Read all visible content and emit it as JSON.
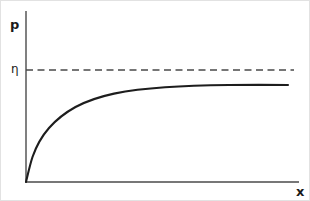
{
  "figure": {
    "background_color": "#ffffff",
    "border_color": "#e2e2e2",
    "axis_color": "#4a4a4a",
    "curve_color": "#1d1d1d"
  },
  "labels": {
    "y_axis": "p",
    "x_axis": "x",
    "asymptote_tick": "η"
  },
  "chart_data": {
    "type": "line",
    "title": "",
    "xlabel": "x",
    "ylabel": "p",
    "grid": false,
    "legend": null,
    "xlim": [
      0,
      1
    ],
    "ylim": [
      0,
      1
    ],
    "axis_ticks": {
      "x": [],
      "y": [
        "η"
      ]
    },
    "annotations": [
      {
        "name": "asymptote",
        "label": "η",
        "style": "dashed-horizontal",
        "y_value": 1.0,
        "x_from": 0.0,
        "x_to": 1.0
      }
    ],
    "series": [
      {
        "name": "saturating-growth-curve",
        "style": "solid",
        "description": "monotonically increasing concave curve rising from the origin and approaching the asymptote η from below",
        "x": [
          0.0,
          0.02,
          0.05,
          0.08,
          0.11,
          0.15,
          0.2,
          0.25,
          0.3,
          0.36,
          0.42,
          0.5,
          0.58,
          0.66,
          0.74,
          0.82,
          0.9,
          1.0
        ],
        "y": [
          0.0,
          0.135,
          0.29,
          0.395,
          0.47,
          0.552,
          0.633,
          0.695,
          0.742,
          0.788,
          0.822,
          0.859,
          0.884,
          0.902,
          0.916,
          0.925,
          0.93,
          0.933
        ]
      }
    ]
  },
  "geometry": {
    "origin": {
      "x": 25,
      "y": 181
    },
    "y_axis_top": 10,
    "x_axis_right": 298,
    "asymptote_y": 69,
    "asymptote_x_end": 293,
    "curve_x_end": 287,
    "curve_plateau_y": 84,
    "curve_path": "M 25 181 C 29 163 32 150 36 140 C 41 128 48 118 57 110 C 68 101 80 96 93 92 C 110 87 129 87 148 87 C 170 87 195 86 218 85 C 242 85 266 84.5 287 84",
    "curve_path_smooth": "M 25.0 181.0 C 27.2 172.0 29.0 163.5 31.5 156.0 C 35.5 144.5 41.0 135.0 48.0 127.0 C 55.5 118.5 64.5 111.5 74.5 106.0 C 86.0 99.8 99.0 95.6 113.0 92.6 C 129.0 89.3 146.0 87.4 164.0 86.2 C 184.0 84.9 206.0 84.3 228.0 84.0 C 248.0 83.8 268.0 83.8 287.0 84.0"
  }
}
